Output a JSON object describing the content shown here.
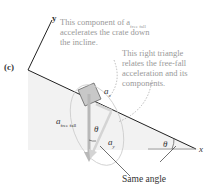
{
  "panel_label": "(c)",
  "axes": {
    "y": "y",
    "x": "x"
  },
  "notes": {
    "component": [
      "This component of a",
      "accelerates the crate down",
      "the incline."
    ],
    "component_sub": "free fall",
    "triangle": [
      "This right triangle",
      "relates the free-fall",
      "acceleration and its",
      "components."
    ]
  },
  "vectors": {
    "a_free_fall": "a",
    "a_free_fall_sub": "free fall",
    "a_x": "a",
    "a_x_sub": "x",
    "a_y": "a",
    "a_y_sub": "y"
  },
  "angles": {
    "theta": "θ"
  },
  "same_angle_label": "Same angle",
  "colors": {
    "incline": "#222222",
    "note": "#999999",
    "vector": "#b8b8b8",
    "crate": "#c8c8c8"
  }
}
